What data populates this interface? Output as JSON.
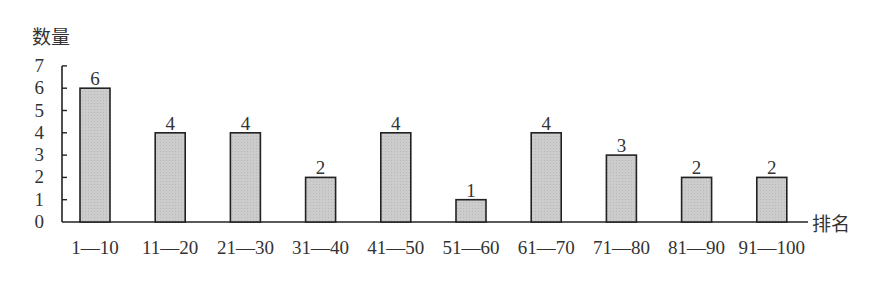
{
  "chart_data": {
    "type": "bar",
    "title": "",
    "xlabel": "排名",
    "ylabel": "数量",
    "categories": [
      "1—10",
      "11—20",
      "21—30",
      "31—40",
      "41—50",
      "51—60",
      "61—70",
      "71—80",
      "81—90",
      "91—100"
    ],
    "values": [
      6,
      4,
      4,
      2,
      4,
      1,
      4,
      3,
      2,
      2
    ],
    "data_labels": [
      "6",
      "4",
      "4",
      "2",
      "4",
      "1",
      "4",
      "3",
      "2",
      "2"
    ],
    "yticks": [
      0,
      1,
      2,
      3,
      4,
      5,
      6,
      7
    ],
    "ylim": [
      0,
      7
    ],
    "grid": false,
    "legend": null,
    "bar_fill": "#cccccc",
    "bar_stroke": "#222222"
  }
}
